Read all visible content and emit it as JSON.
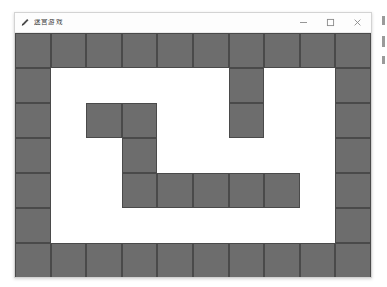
{
  "window": {
    "title": "迷宫游戏",
    "icon": "pencil-icon",
    "controls": {
      "minimize_label": "–",
      "maximize_label": "□",
      "close_label": "✕"
    }
  },
  "colors": {
    "wall": "#6d6d6d",
    "wall_border": "#4a4a4a",
    "path": "#ffffff",
    "window_background": "#ffffff",
    "titlebar_background": "#fdfdfd",
    "window_border": "#d3d3d3",
    "title_text": "#3a3a3a"
  },
  "maze": {
    "name": "maze-grid",
    "columns": 10,
    "rows": 7,
    "cell_width_px": 35.6,
    "cell_height_px": 35,
    "legend": {
      "1": "wall",
      "0": "path"
    },
    "grid": [
      [
        1,
        1,
        1,
        1,
        1,
        1,
        1,
        1,
        1,
        1
      ],
      [
        1,
        0,
        0,
        0,
        0,
        0,
        1,
        0,
        0,
        1
      ],
      [
        1,
        0,
        1,
        1,
        0,
        0,
        1,
        0,
        0,
        1
      ],
      [
        1,
        0,
        0,
        1,
        0,
        0,
        0,
        0,
        0,
        1
      ],
      [
        1,
        0,
        0,
        1,
        1,
        1,
        1,
        1,
        0,
        1
      ],
      [
        1,
        0,
        0,
        0,
        0,
        0,
        0,
        0,
        0,
        1
      ],
      [
        1,
        1,
        1,
        1,
        1,
        1,
        1,
        1,
        1,
        1
      ]
    ]
  },
  "edge_artifacts": {
    "count": 3
  }
}
